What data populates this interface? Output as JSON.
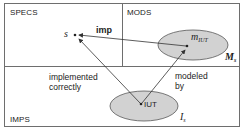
{
  "regions": {
    "specs": "SPECS",
    "mods": "MODS",
    "imps": "IMPS"
  },
  "nodes": {
    "spec": "s",
    "model_main": "m",
    "model_sub": "IUT",
    "iut": "IUT",
    "model_set_main": "M",
    "model_set_sub": "s",
    "imp_set_main": "I",
    "imp_set_sub": "s"
  },
  "edges": {
    "imp": "imp",
    "implemented_line1": "implemented",
    "implemented_line2": "correctly",
    "modeled_line1": "modeled",
    "modeled_line2": "by"
  },
  "colors": {
    "border": "#6e6e6e",
    "ellipse_fill": "#d2d2d2",
    "ellipse_stroke": "#555555",
    "arrow": "#333333"
  }
}
